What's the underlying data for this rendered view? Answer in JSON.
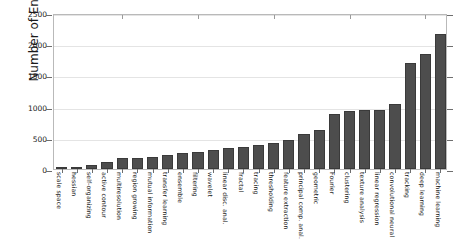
{
  "chart_data": {
    "type": "bar",
    "title": "",
    "xlabel": "",
    "ylabel": "Number of Entries",
    "ylim": [
      0,
      2500
    ],
    "ytick_labels": [
      "0",
      "500",
      "1000",
      "1500",
      "2000",
      "2500"
    ],
    "ytick_values": [
      0,
      500,
      1000,
      1500,
      2000,
      2500
    ],
    "grid": true,
    "legend": "none",
    "bar_color": "#4d4d4d",
    "categories": [
      "scale space",
      "hessian",
      "self-organizing",
      "active contour",
      "multiresolution",
      "region growing",
      "mutual information",
      "transfer learning",
      "ensemble",
      "filtering",
      "wavelet",
      "linear disc. anal.",
      "fractal",
      "tracing",
      "thresholding",
      "feature extraction",
      "principal comp. anal.",
      "geometric",
      "Fourier",
      "clustering",
      "texture analysis",
      "linear regression",
      "convolutional neural",
      "tracking",
      "deep learning",
      "machine learning"
    ],
    "values": [
      20,
      40,
      60,
      110,
      170,
      180,
      200,
      230,
      250,
      280,
      300,
      330,
      350,
      390,
      420,
      470,
      560,
      620,
      880,
      930,
      940,
      950,
      1040,
      1700,
      1850,
      2160
    ]
  },
  "axis": {
    "y_title": "Number of Entries"
  }
}
